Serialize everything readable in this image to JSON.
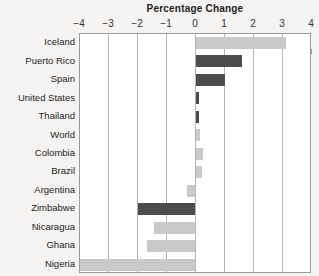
{
  "chart_data": {
    "type": "bar",
    "orientation": "horizontal",
    "title": "Percentage Change",
    "xlabel": "",
    "ylabel": "",
    "xlim": [
      -4,
      4
    ],
    "xticks": [
      -4,
      -3,
      -2,
      -1,
      0,
      1,
      2,
      3,
      4
    ],
    "xticklabels": [
      "−4",
      "−3",
      "−2",
      "−1",
      "0",
      "1",
      "2",
      "3",
      "4"
    ],
    "grid": true,
    "legend": "none",
    "categories": [
      "Iceland",
      "Puerto Rico",
      "Spain",
      "United States",
      "Thailand",
      "World",
      "Colombia",
      "Brazil",
      "Argentina",
      "Zimbabwe",
      "Nicaragua",
      "Ghana",
      "Nigeria"
    ],
    "values": [
      3.1,
      1.6,
      1.0,
      0.1,
      0.1,
      0.15,
      0.25,
      0.2,
      -0.3,
      -2.0,
      -1.45,
      -1.7,
      -4.4
    ],
    "bar_shades": [
      "light",
      "dark",
      "dark",
      "dark",
      "dark",
      "light",
      "light",
      "light",
      "light",
      "dark",
      "light",
      "light",
      "light"
    ],
    "clipped": [
      false,
      false,
      false,
      false,
      false,
      false,
      false,
      false,
      false,
      false,
      false,
      false,
      true
    ]
  },
  "colors": {
    "background": "#f5f4f2",
    "plot_background": "#ffffff",
    "bar_light": "#c9c9c9",
    "bar_dark": "#4c4c4c",
    "gridline": "#b5b5b5",
    "frame": "#9a9a9a",
    "text": "#222222"
  }
}
